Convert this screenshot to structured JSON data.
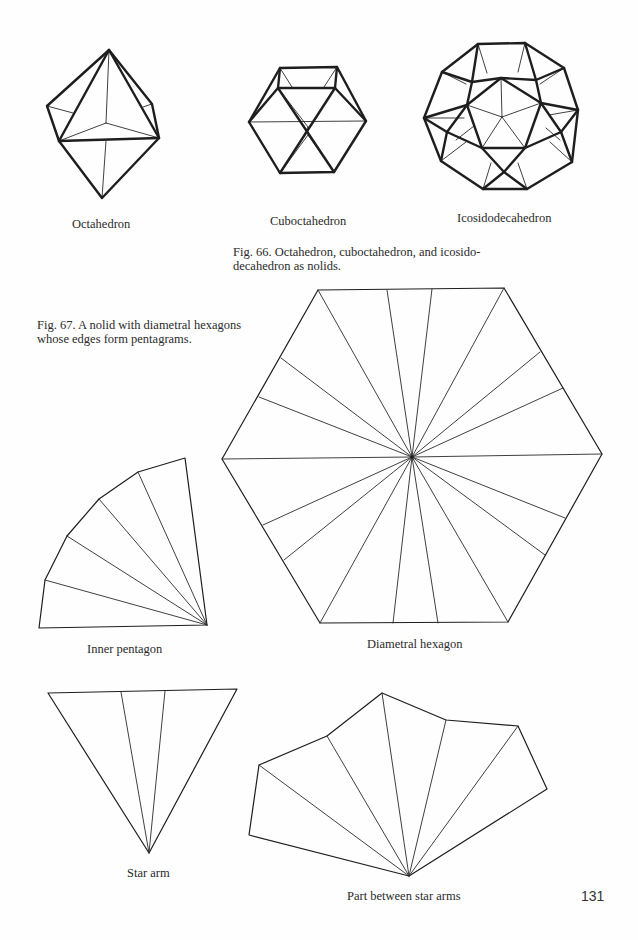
{
  "figures": {
    "fig66": {
      "items": [
        {
          "name": "octahedron",
          "label": "Octahedron"
        },
        {
          "name": "cuboctahedron",
          "label": "Cuboctahedron"
        },
        {
          "name": "icosidodecahedron",
          "label": "Icosidodecahedron"
        }
      ],
      "caption_line1": "Fig. 66. Octahedron, cuboctahedron, and icosido-",
      "caption_line2": "decahedron as nolids."
    },
    "fig67": {
      "caption_line1": "Fig. 67. A nolid with diametral hexagons",
      "caption_line2": "whose edges form pentagrams.",
      "items": [
        {
          "name": "diametral-hexagon",
          "label": "Diametral hexagon"
        },
        {
          "name": "inner-pentagon",
          "label": "Inner pentagon"
        },
        {
          "name": "star-arm",
          "label": "Star arm"
        },
        {
          "name": "part-between-star-arms",
          "label": "Part between star arms"
        }
      ]
    }
  },
  "page_number": "131",
  "colors": {
    "ink": "#1e1e1e",
    "paper": "#fefefe"
  }
}
